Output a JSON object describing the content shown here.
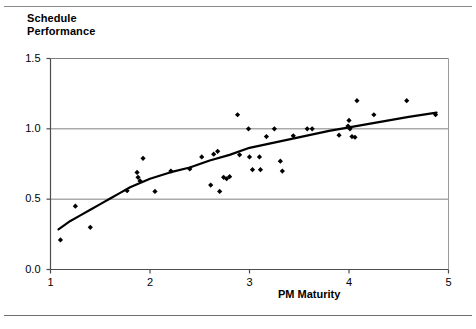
{
  "figure": {
    "title_line1": "Schedule",
    "title_line2": "Performance",
    "title": "Schedule\nPerformance"
  },
  "axes": {
    "x_label": "PM Maturity",
    "y_label": "Schedule Performance",
    "x_ticks": [
      "1",
      "2",
      "3",
      "4",
      "5"
    ],
    "y_ticks": [
      "0.0",
      "0.5",
      "1.0",
      "1.5"
    ]
  },
  "chart_data": {
    "type": "scatter",
    "title": "Schedule Performance",
    "xlabel": "PM Maturity",
    "ylabel": "Schedule Performance",
    "xlim": [
      1,
      5
    ],
    "ylim": [
      0.0,
      1.5
    ],
    "x_ticks": [
      1,
      2,
      3,
      4,
      5
    ],
    "y_ticks": [
      0.0,
      0.5,
      1.0,
      1.5
    ],
    "grid": "horizontal",
    "legend": "none",
    "series": [
      {
        "name": "Projects",
        "marker": "diamond",
        "color": "#000000",
        "points": [
          [
            1.1,
            0.21
          ],
          [
            1.25,
            0.45
          ],
          [
            1.4,
            0.3
          ],
          [
            1.77,
            0.56
          ],
          [
            1.87,
            0.69
          ],
          [
            1.88,
            0.655
          ],
          [
            1.9,
            0.63
          ],
          [
            1.93,
            0.79
          ],
          [
            2.05,
            0.555
          ],
          [
            2.21,
            0.7
          ],
          [
            2.4,
            0.715
          ],
          [
            2.52,
            0.8
          ],
          [
            2.61,
            0.6
          ],
          [
            2.64,
            0.82
          ],
          [
            2.68,
            0.84
          ],
          [
            2.7,
            0.555
          ],
          [
            2.74,
            0.655
          ],
          [
            2.77,
            0.645
          ],
          [
            2.8,
            0.66
          ],
          [
            2.88,
            1.1
          ],
          [
            2.9,
            0.815
          ],
          [
            2.99,
            1.0
          ],
          [
            3.0,
            0.8
          ],
          [
            3.03,
            0.71
          ],
          [
            3.1,
            0.8
          ],
          [
            3.11,
            0.71
          ],
          [
            3.17,
            0.945
          ],
          [
            3.25,
            1.0
          ],
          [
            3.31,
            0.77
          ],
          [
            3.33,
            0.7
          ],
          [
            3.44,
            0.95
          ],
          [
            3.58,
            1.0
          ],
          [
            3.63,
            1.0
          ],
          [
            3.9,
            0.955
          ],
          [
            3.99,
            1.02
          ],
          [
            4.0,
            1.06
          ],
          [
            4.01,
            1.0
          ],
          [
            4.03,
            0.945
          ],
          [
            4.06,
            0.94
          ],
          [
            4.08,
            1.2
          ],
          [
            4.25,
            1.1
          ],
          [
            4.58,
            1.2
          ],
          [
            4.87,
            1.1
          ]
        ]
      },
      {
        "name": "Trend (logarithmic fit)",
        "marker": "none",
        "type": "line",
        "color": "#000000",
        "points": [
          [
            1.08,
            0.285
          ],
          [
            1.2,
            0.345
          ],
          [
            1.3,
            0.385
          ],
          [
            1.4,
            0.425
          ],
          [
            1.5,
            0.465
          ],
          [
            1.6,
            0.505
          ],
          [
            1.7,
            0.545
          ],
          [
            1.8,
            0.585
          ],
          [
            1.9,
            0.615
          ],
          [
            2.0,
            0.645
          ],
          [
            2.2,
            0.69
          ],
          [
            2.4,
            0.725
          ],
          [
            2.6,
            0.775
          ],
          [
            2.8,
            0.815
          ],
          [
            3.0,
            0.865
          ],
          [
            3.2,
            0.895
          ],
          [
            3.4,
            0.925
          ],
          [
            3.6,
            0.955
          ],
          [
            3.8,
            0.985
          ],
          [
            4.0,
            1.01
          ],
          [
            4.2,
            1.035
          ],
          [
            4.4,
            1.06
          ],
          [
            4.6,
            1.085
          ],
          [
            4.88,
            1.115
          ]
        ]
      }
    ]
  }
}
